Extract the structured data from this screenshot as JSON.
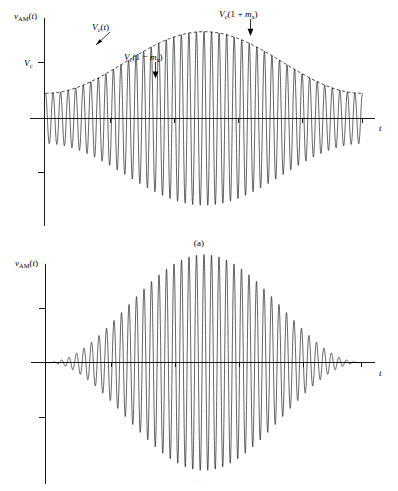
{
  "figure": {
    "panels": [
      {
        "id": "a",
        "caption": "(a)",
        "y_axis_label": "v",
        "y_axis_label_sub": "AM",
        "y_axis_label_arg": "(t)",
        "x_axis_label": "t",
        "annotations": [
          {
            "name": "carrier-level",
            "text": "V",
            "sub": "c",
            "tail": ""
          },
          {
            "name": "envelope",
            "text": "V",
            "sub": "c",
            "tail": "(t)"
          },
          {
            "name": "envelope-min",
            "text": "V",
            "sub": "c",
            "tail": "(1 − m",
            "tail_sub": "a",
            "tail_end": ")"
          },
          {
            "name": "envelope-max",
            "text": "V",
            "sub": "c",
            "tail": "(1 + m",
            "tail_sub": "a",
            "tail_end": ")"
          }
        ]
      },
      {
        "id": "b",
        "caption": "(b)",
        "y_axis_label": "v",
        "y_axis_label_sub": "AM",
        "y_axis_label_arg": "(t)",
        "x_axis_label": "t",
        "annotations": []
      }
    ]
  },
  "chart_data": [
    {
      "type": "line",
      "name": "am-waveform-under-modulated",
      "title": "",
      "xlabel": "t",
      "ylabel": "v_AM(t)",
      "grid": false,
      "legend": "none",
      "xlim": [
        0,
        1
      ],
      "ylim": [
        -2,
        2
      ],
      "description": "Amplitude modulated carrier with modulation index m_a less than 1; envelope never reaches zero.",
      "parameters": {
        "carrier_amplitude_Vc": 1.0,
        "modulation_index_ma": 0.55,
        "carrier_cycles": 42,
        "modulating_cycles": 1.0,
        "modulating_phase_deg": 180,
        "envelope_max_value": 1.55,
        "envelope_min_value": 0.45,
        "envelope_start_value": 1.45,
        "envelope_end_value": 0.62
      },
      "annotations": [
        {
          "label": "V_c(t)",
          "target_x": 0.3,
          "target_y": 1.02,
          "text_x": 0.24,
          "text_y": 1.82
        },
        {
          "label": "V_c(1 - m_a)",
          "target_x": 0.36,
          "target_y": 0.45,
          "text_x": 0.36,
          "text_y": 1.28
        },
        {
          "label": "V_c(1 + m_a)",
          "target_x": 0.655,
          "target_y": 1.55,
          "text_x": 0.655,
          "text_y": 2.0
        },
        {
          "label": "V_c",
          "target_x": 0.0,
          "target_y": 1.0,
          "text_x": -0.06,
          "text_y": 1.0
        }
      ],
      "x_ticks": [
        0.2,
        0.4,
        0.6,
        0.8,
        1.0
      ],
      "y_ticks": [
        -1.0,
        1.0
      ]
    },
    {
      "type": "line",
      "name": "am-waveform-fully-modulated",
      "title": "",
      "xlabel": "t",
      "ylabel": "v_AM(t)",
      "grid": false,
      "legend": "none",
      "xlim": [
        0,
        1
      ],
      "ylim": [
        -2,
        2
      ],
      "description": "Amplitude modulated carrier with modulation index m_a equal to 1 (100% modulation); envelope touches zero.",
      "parameters": {
        "carrier_amplitude_Vc": 1.0,
        "modulation_index_ma": 1.0,
        "carrier_cycles": 42,
        "modulating_cycles": 1.0,
        "modulating_phase_deg": 180,
        "envelope_max_value": 2.0,
        "envelope_min_value": 0.0,
        "envelope_start_value": 1.9,
        "envelope_end_value": 0.1
      },
      "annotations": [],
      "x_ticks": [
        0.2,
        0.4,
        0.6,
        0.8,
        1.0
      ],
      "y_ticks": [
        -1.0,
        1.0
      ]
    }
  ]
}
